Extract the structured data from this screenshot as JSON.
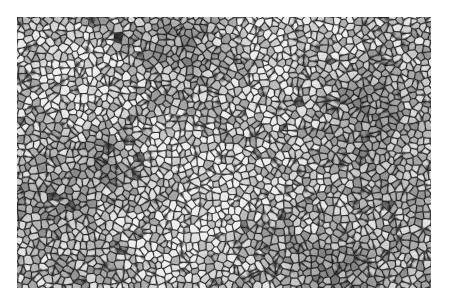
{
  "image": {
    "description": "Grayscale micrograph-like texture of densely packed polygonal granules/cells with dark boundaries",
    "region": {
      "x": 17,
      "y": 17,
      "width": 414,
      "height": 271
    },
    "texture": {
      "cell_size_px": 7,
      "cell_light": "#e6e6e6",
      "cell_mid": "#9a9a9a",
      "boundary_dark": "#242424",
      "mean_tone": "#8a8a8a",
      "seed": 1337
    }
  }
}
